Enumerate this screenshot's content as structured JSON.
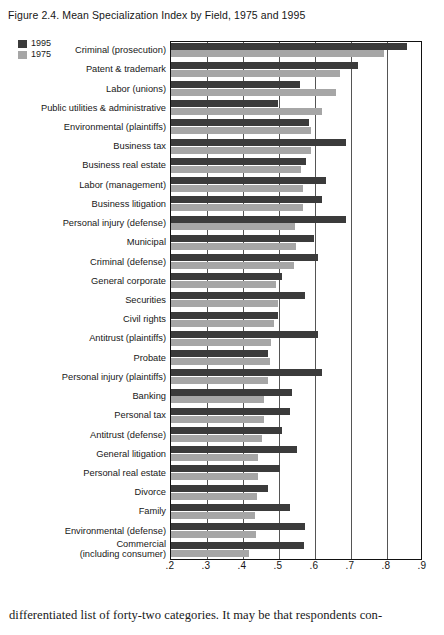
{
  "figure": {
    "title": "Figure 2.4.  Mean Specialization Index by Field, 1975 and 1995"
  },
  "legend": {
    "position": "top-left",
    "items": [
      {
        "label": "1995",
        "color": "#3b3b3b",
        "name": "legend-swatch-1995"
      },
      {
        "label": "1975",
        "color": "#a6a6a6",
        "name": "legend-swatch-1975"
      }
    ]
  },
  "footer": {
    "text": "differentiated list of forty-two categories. It may be that respondents con-"
  },
  "chart_data": {
    "type": "bar",
    "orientation": "horizontal",
    "title": "Mean Specialization Index by Field, 1975 and 1995",
    "xlabel": "",
    "ylabel": "",
    "xlim": [
      0.2,
      0.9
    ],
    "xticks": [
      0.2,
      0.3,
      0.4,
      0.5,
      0.6,
      0.7,
      0.8,
      0.9
    ],
    "xtick_labels": [
      ".2",
      ".3",
      ".4",
      ".5",
      ".6",
      ".7",
      ".8",
      ".9"
    ],
    "grid": "vertical",
    "legend_position": "top-left",
    "categories": [
      "Criminal (prosecution)",
      "Patent & trademark",
      "Labor (unions)",
      "Public utilities & administrative",
      "Environmental (plaintiffs)",
      "Business tax",
      "Business real estate",
      "Labor (management)",
      "Business litigation",
      "Personal injury (defense)",
      "Municipal",
      "Criminal (defense)",
      "General corporate",
      "Securities",
      "Civil rights",
      "Antitrust (plaintiffs)",
      "Probate",
      "Personal injury (plaintiffs)",
      "Banking",
      "Personal tax",
      "Antitrust (defense)",
      "General litigation",
      "Personal real estate",
      "Divorce",
      "Family",
      "Environmental (defense)",
      "Commercial\n(including consumer)"
    ],
    "series": [
      {
        "name": "1995",
        "color": "#3b3b3b",
        "values": [
          0.857,
          0.722,
          0.561,
          0.5,
          0.586,
          0.689,
          0.578,
          0.633,
          0.622,
          0.689,
          0.6,
          0.611,
          0.511,
          0.575,
          0.5,
          0.611,
          0.472,
          0.622,
          0.539,
          0.533,
          0.511,
          0.553,
          0.506,
          0.472,
          0.533,
          0.575,
          0.572
        ]
      },
      {
        "name": "1975",
        "color": "#a6a6a6",
        "values": [
          0.794,
          0.672,
          0.661,
          0.622,
          0.592,
          0.592,
          0.564,
          0.569,
          0.569,
          0.547,
          0.55,
          0.544,
          0.494,
          0.5,
          0.489,
          0.481,
          0.478,
          0.472,
          0.461,
          0.461,
          0.456,
          0.444,
          0.444,
          0.442,
          0.436,
          0.439,
          0.42
        ]
      }
    ]
  }
}
